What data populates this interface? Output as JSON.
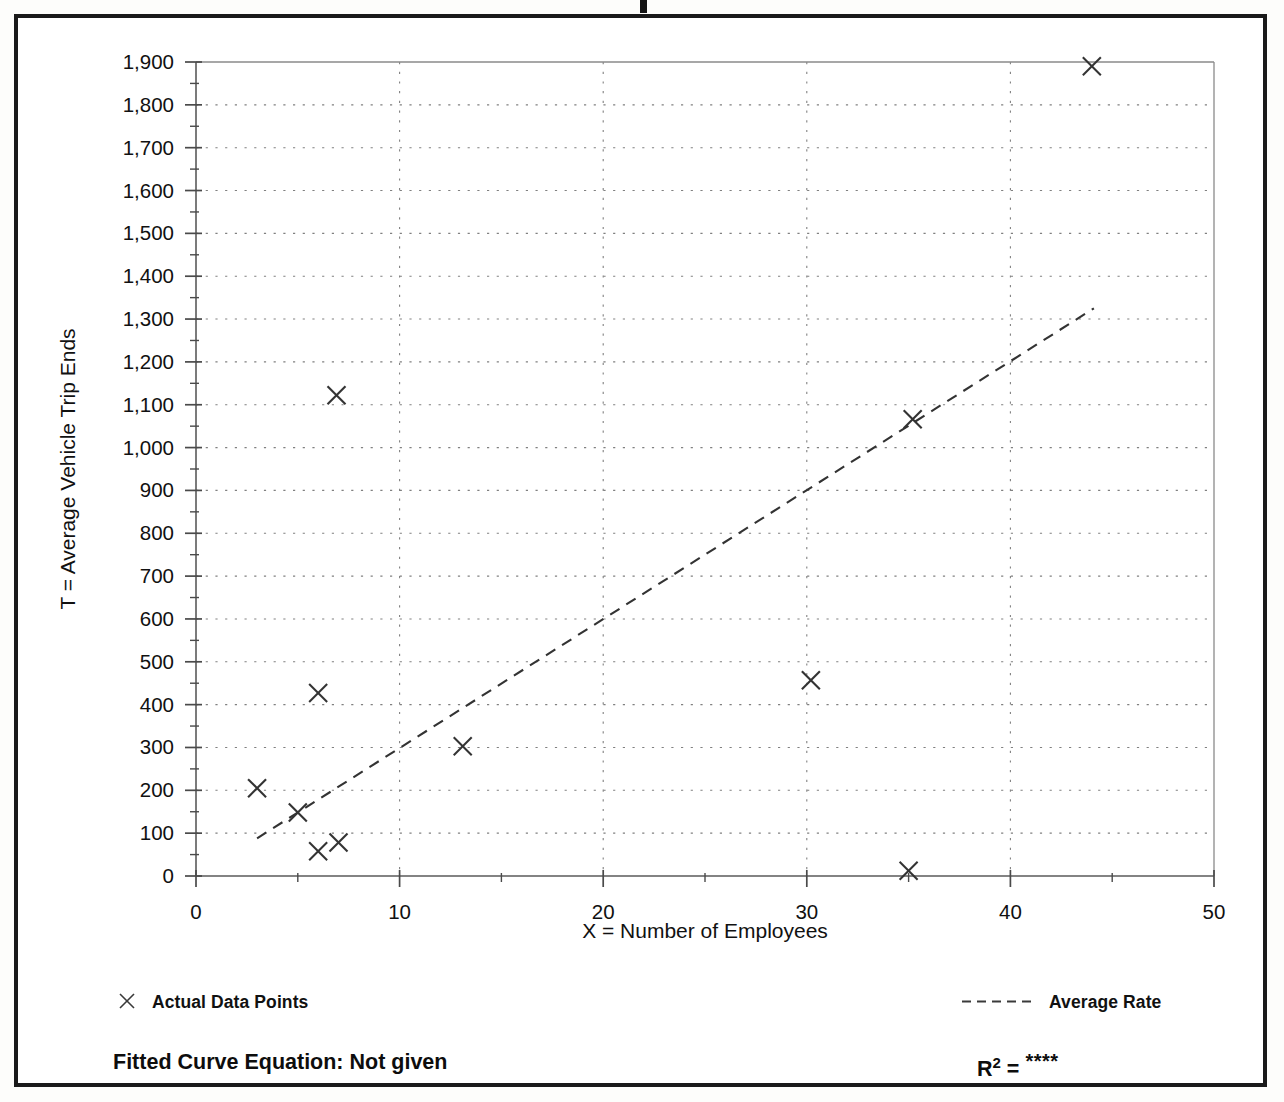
{
  "figure": {
    "background_color": "#ffffff",
    "frame_color": "#1a1a1a",
    "data_color": "#333333",
    "grid_color": "#808080"
  },
  "legend": {
    "position": "below-axis",
    "items": [
      {
        "marker": "x-marker-icon",
        "label": "Actual Data Points"
      },
      {
        "marker": "dashed-line-icon",
        "label": "Average Rate"
      }
    ]
  },
  "footer": {
    "equation_label": "Fitted Curve Equation:  Not given",
    "r2_prefix": "R",
    "r2_exponent": "2",
    "r2_equals": " = ",
    "r2_value": "****"
  },
  "chart_data": {
    "type": "scatter",
    "title": "",
    "xlabel": "X = Number of Employees",
    "ylabel": "T = Average Vehicle Trip Ends",
    "xlim": [
      0,
      50
    ],
    "ylim": [
      0,
      1900
    ],
    "xticks": [
      0,
      10,
      20,
      30,
      40,
      50
    ],
    "xtick_labels": [
      "0",
      "10",
      "20",
      "30",
      "40",
      "50"
    ],
    "xminor_step": 5,
    "yticks": [
      0,
      100,
      200,
      300,
      400,
      500,
      600,
      700,
      800,
      900,
      1000,
      1100,
      1200,
      1300,
      1400,
      1500,
      1600,
      1700,
      1800,
      1900
    ],
    "ytick_labels": [
      "0",
      "100",
      "200",
      "300",
      "400",
      "500",
      "600",
      "700",
      "800",
      "900",
      "1,000",
      "1,100",
      "1,200",
      "1,300",
      "1,400",
      "1,500",
      "1,600",
      "1,700",
      "1,800",
      "1,900"
    ],
    "yminor_step": 50,
    "grid": true,
    "grid_style": "dotted",
    "series": [
      {
        "name": "Actual Data Points",
        "marker": "x",
        "points": [
          {
            "x": 3.0,
            "y": 205
          },
          {
            "x": 5.0,
            "y": 148
          },
          {
            "x": 6.0,
            "y": 58
          },
          {
            "x": 7.0,
            "y": 78
          },
          {
            "x": 6.0,
            "y": 427
          },
          {
            "x": 6.9,
            "y": 1122
          },
          {
            "x": 13.1,
            "y": 303
          },
          {
            "x": 30.2,
            "y": 457
          },
          {
            "x": 35.2,
            "y": 1066
          },
          {
            "x": 35.0,
            "y": 12
          },
          {
            "x": 44.0,
            "y": 1890
          }
        ]
      },
      {
        "name": "Average Rate",
        "type": "line",
        "style": "dashed",
        "endpoints": [
          {
            "x": 3.0,
            "y": 88
          },
          {
            "x": 44.1,
            "y": 1325
          }
        ],
        "slope_per_employee": 30.1
      }
    ]
  }
}
